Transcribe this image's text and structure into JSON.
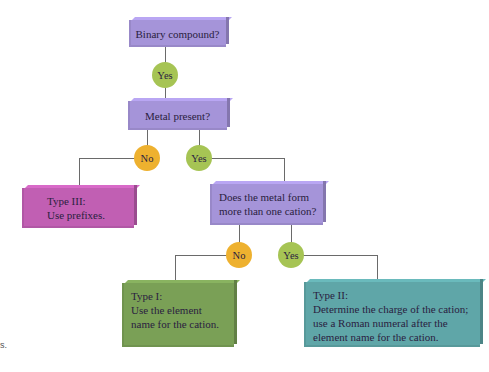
{
  "flowchart": {
    "title_node": {
      "text": "Binary compound?"
    },
    "answer1": {
      "text": "Yes"
    },
    "metal_node": {
      "text": "Metal present?"
    },
    "metal_no": {
      "text": "No"
    },
    "metal_yes": {
      "text": "Yes"
    },
    "type3": {
      "line1": "Type III:",
      "line2": "Use prefixes."
    },
    "cation_node": {
      "line1": "Does the metal form",
      "line2": "more than one cation?"
    },
    "cation_no": {
      "text": "No"
    },
    "cation_yes": {
      "text": "Yes"
    },
    "type1": {
      "line1": "Type I:",
      "line2": "Use the element",
      "line3": "name for the cation."
    },
    "type2": {
      "line1": "Type II:",
      "line2": "Determine the charge of the cation;",
      "line3": "use a Roman numeral after the",
      "line4": "element name for the cation."
    },
    "margin_fragment": "s.",
    "colors": {
      "question_box": "#a594d9",
      "type3_box": "#c15fb3",
      "type1_box": "#7aa056",
      "type2_box": "#5fa6a8",
      "yes_circle": "#a6c454",
      "no_circle": "#eeb12f"
    }
  }
}
